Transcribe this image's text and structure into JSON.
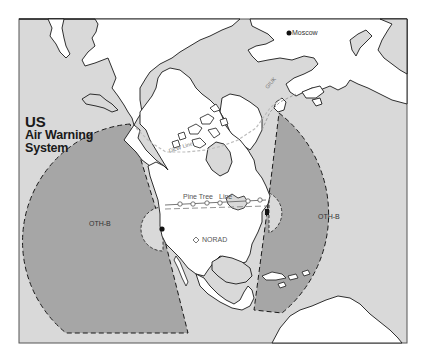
{
  "title": {
    "line1": "US",
    "line2": "Air Warning",
    "line3": "System"
  },
  "labels": {
    "moscow": "Moscow",
    "giuk": "GIUK",
    "dew_line": "DEW Line",
    "pine_tree_line_1": "Pine Tree",
    "pine_tree_line_2": "Line",
    "norad": "NORAD",
    "oth_west": "OTH-B",
    "oth_east": "OTH-B"
  },
  "colors": {
    "ocean": "#d9d9d9",
    "land": "#ffffff",
    "radar_coverage": "#a6a6a6",
    "coastline": "#1a1a1a",
    "frame": "#555555"
  },
  "markers": [
    {
      "name": "Moscow",
      "type": "filled-dot"
    },
    {
      "name": "NORAD",
      "type": "open-diamond"
    },
    {
      "name": "West OTH-B radar site",
      "type": "filled-dot"
    },
    {
      "name": "East OTH-B radar site",
      "type": "filled-dot"
    }
  ]
}
